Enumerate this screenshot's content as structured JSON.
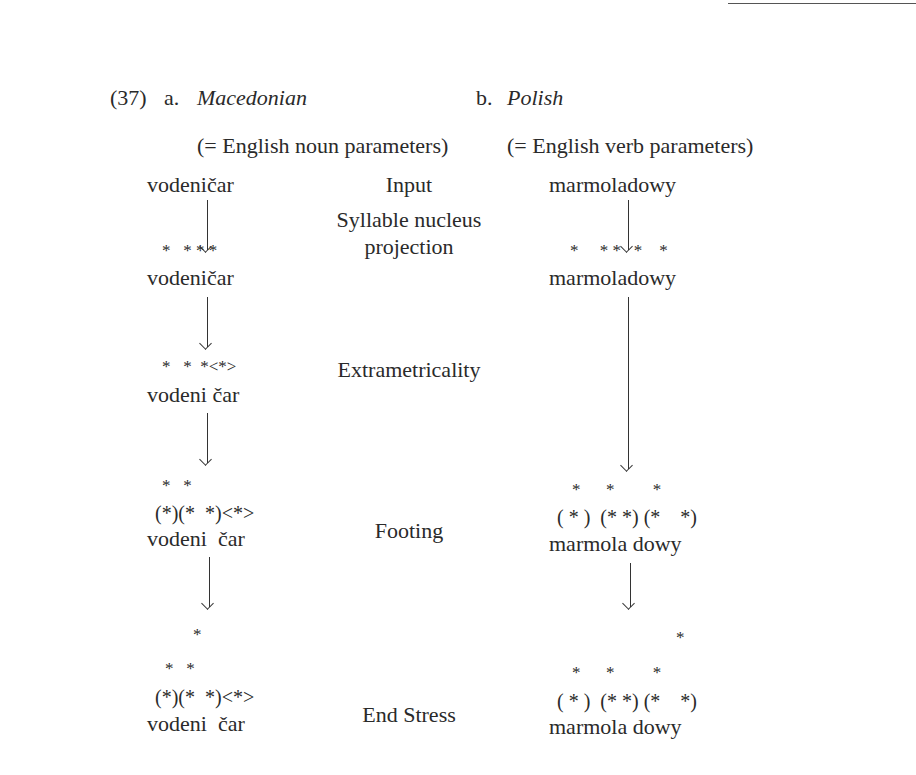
{
  "example": {
    "number": "(37)",
    "a": {
      "label": "a.",
      "language": "Macedonian",
      "params": "(= English noun parameters)",
      "input": "vodeničar",
      "stars1": "*   * * *",
      "word1": "vodeničar",
      "stars2": "*   *  *<*>",
      "word2": "vodeni čar",
      "foot_top": "*   *",
      "foot_grid": "(*)(*  *)<*>",
      "word3": "vodeni  čar",
      "end_top": "*",
      "end_mid": "*   *",
      "end_grid": "(*)(*  *)<*>",
      "word4": "vodeni  čar"
    },
    "b": {
      "label": "b.",
      "language": "Polish",
      "params": "(= English verb parameters)",
      "input": "marmoladowy",
      "stars1": "*     * *   *    *",
      "word1": "marmoladowy",
      "foot_top": "*      *         *",
      "foot_grid": "( * )  (* *) (*    *)",
      "word2": "marmola dowy",
      "end_top": "*",
      "end_mid": "*      *         *",
      "end_grid": "( * )  (* *) (*    *)",
      "word3": "marmola dowy"
    },
    "steps": {
      "input": "Input",
      "syllable_1": "Syllable nucleus",
      "syllable_2": "projection",
      "extrametricality": "Extrametricality",
      "footing": "Footing",
      "end_stress": "End Stress"
    }
  }
}
